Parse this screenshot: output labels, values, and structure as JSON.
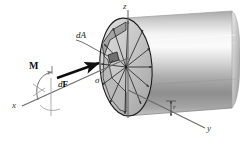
{
  "figure": {
    "background_color": "#ffffff",
    "axes": {
      "z_label": "z",
      "y_label": "y",
      "x_label": "x"
    },
    "labels": {
      "moment": "M",
      "area_element": "dA",
      "force_element_d": "d",
      "force_element_F": "F",
      "stress": "σ",
      "radius": "r"
    },
    "colors": {
      "outline": "#1a1a1a",
      "axis": "#6b6b6b",
      "cylinder_light": "#f2f2f2",
      "cylinder_mid": "#b9b9b9",
      "cylinder_dark": "#6e6e6e",
      "face_fill": "#cccccc",
      "face_shadow": "#9a9a9a",
      "element_fill": "#7d7d7d",
      "arrow": "#111111"
    }
  }
}
